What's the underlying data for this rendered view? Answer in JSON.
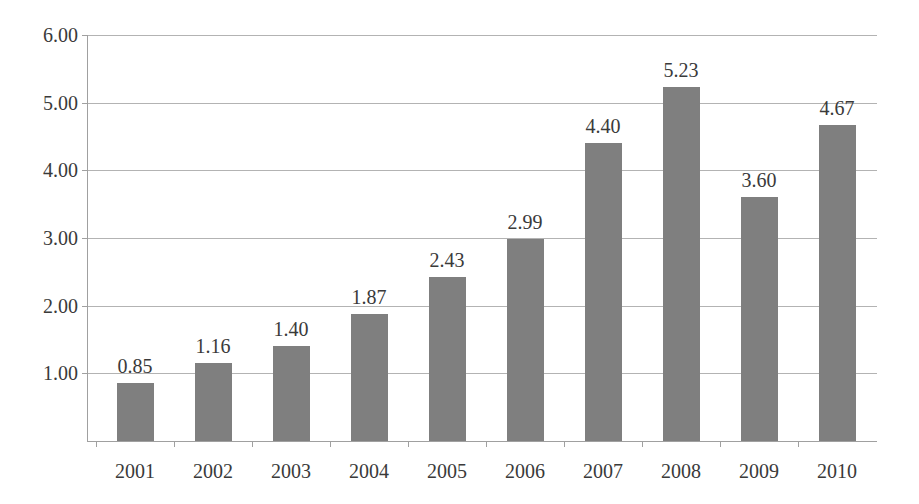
{
  "chart_data": {
    "type": "bar",
    "title": "",
    "subtitle": "",
    "xlabel": "",
    "ylabel": "",
    "categories": [
      "2001",
      "2002",
      "2003",
      "2004",
      "2005",
      "2006",
      "2007",
      "2008",
      "2009",
      "2010"
    ],
    "values": [
      0.85,
      1.16,
      1.4,
      1.87,
      2.43,
      2.99,
      4.4,
      5.23,
      3.6,
      4.67
    ],
    "value_labels": [
      "0.85",
      "1.16",
      "1.40",
      "1.87",
      "2.43",
      "2.99",
      "4.40",
      "5.23",
      "3.60",
      "4.67"
    ],
    "ylim": [
      0,
      6
    ],
    "ytick_values": [
      6.0,
      5.0,
      4.0,
      3.0,
      2.0,
      1.0
    ],
    "ytick_labels": [
      "6.00",
      "5.00",
      "4.00",
      "3.00",
      "2.00",
      "1.00"
    ],
    "grid": true,
    "legend": false,
    "legend_position": "none",
    "series": [
      {
        "name": "",
        "values": [
          0.85,
          1.16,
          1.4,
          1.87,
          2.43,
          2.99,
          4.4,
          5.23,
          3.6,
          4.67
        ],
        "color": "#7f7f7f"
      }
    ]
  },
  "style": {
    "bar_color": "#7f7f7f",
    "gridline_color": "#b3b3b3",
    "axis_color": "#a0a0a0",
    "text_color": "#3a3a3a",
    "background": "#ffffff"
  }
}
